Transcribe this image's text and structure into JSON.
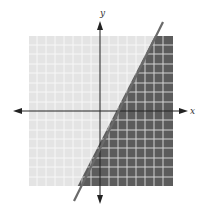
{
  "graph": {
    "type": "linear-inequality",
    "boundary_line": "y = 2x - 4",
    "shaded_region": "below-right of line",
    "axis_labels": {
      "x": "x",
      "y": "y"
    },
    "x_range": [
      -8,
      8
    ],
    "y_range": [
      -8,
      8
    ],
    "x_intercept": 2,
    "y_intercept": -4,
    "colors": {
      "light_region": "#e4e4e4",
      "dark_region": "#5c5c5c",
      "grid_on_light": "#f6f6f6",
      "grid_on_dark": "#cfcfcf",
      "axis": "#222222",
      "boundary": "#6a6a6a"
    }
  }
}
